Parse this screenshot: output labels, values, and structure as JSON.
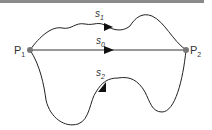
{
  "diagram": {
    "points": [
      {
        "id": "P1",
        "label": "P",
        "sub": "1",
        "x": 30,
        "y": 50
      },
      {
        "id": "P2",
        "label": "P",
        "sub": "2",
        "x": 186,
        "y": 50
      }
    ],
    "paths": [
      {
        "id": "s1",
        "label": "s",
        "sub": "1"
      },
      {
        "id": "s0",
        "label": "s",
        "sub": "0"
      },
      {
        "id": "s2",
        "label": "s",
        "sub": "2"
      }
    ],
    "colors": {
      "line": "#222222",
      "point": "#777777",
      "topbar": "#8a8a8a"
    }
  }
}
